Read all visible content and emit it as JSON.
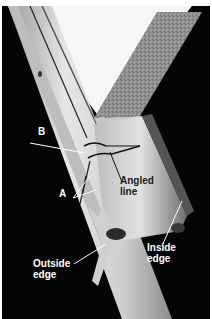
{
  "figure": {
    "colors": {
      "background": "#050505",
      "metal_light": "#d8d8d8",
      "metal_mid": "#a8a8a8",
      "galvanized": "#8a8a8a",
      "paper_white": "#f6f6f6",
      "label_white": "#ffffff",
      "label_dark": "#1a1a1a"
    },
    "labels": {
      "b": "B",
      "a": "A",
      "angled_line": "Angled\nline",
      "outside_edge": "Outside\nedge",
      "inside_edge": "Inside\nedge"
    }
  }
}
